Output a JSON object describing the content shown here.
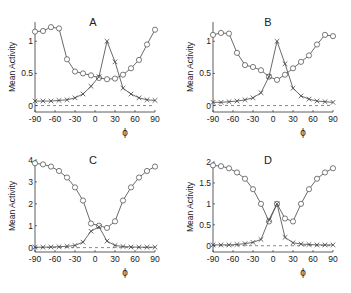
{
  "chart_data": [
    {
      "type": "line",
      "title": "A",
      "xlabel": "ϕ",
      "ylabel": "Mean Activity",
      "xlim": [
        -90,
        90
      ],
      "ylim": [
        -0.1,
        1.3
      ],
      "xticks": [
        -90,
        -60,
        -30,
        0,
        30,
        60,
        90
      ],
      "yticks": [
        0,
        0.5,
        1
      ],
      "ytick_labels": [
        "0",
        "0.5",
        "1"
      ],
      "x": [
        -90,
        -78,
        -66,
        -54,
        -42,
        -30,
        -18,
        -6,
        6,
        18,
        30,
        42,
        54,
        66,
        78,
        90
      ],
      "series": [
        {
          "name": "circles",
          "marker": "o",
          "values": [
            1.15,
            1.16,
            1.22,
            1.2,
            0.72,
            0.53,
            0.5,
            0.47,
            0.43,
            0.41,
            0.42,
            0.48,
            0.58,
            0.71,
            0.95,
            1.18
          ]
        },
        {
          "name": "crosses",
          "marker": "x",
          "values": [
            0.07,
            0.07,
            0.07,
            0.08,
            0.09,
            0.12,
            0.18,
            0.3,
            0.45,
            1.0,
            0.68,
            0.27,
            0.18,
            0.12,
            0.09,
            0.08
          ]
        }
      ],
      "baseline": 0
    },
    {
      "type": "line",
      "title": "B",
      "xlabel": "ϕ",
      "ylabel": "Mean Activity",
      "xlim": [
        -90,
        90
      ],
      "ylim": [
        -0.1,
        1.3
      ],
      "xticks": [
        -90,
        -60,
        -30,
        0,
        30,
        60,
        90
      ],
      "yticks": [
        0,
        0.5,
        1
      ],
      "ytick_labels": [
        "0",
        "0.5",
        "1"
      ],
      "x": [
        -90,
        -78,
        -66,
        -54,
        -42,
        -30,
        -18,
        -6,
        6,
        18,
        30,
        42,
        54,
        66,
        78,
        90
      ],
      "series": [
        {
          "name": "circles",
          "marker": "o",
          "values": [
            1.1,
            1.13,
            1.12,
            0.82,
            0.63,
            0.6,
            0.55,
            0.45,
            0.4,
            0.48,
            0.58,
            0.68,
            0.78,
            0.95,
            1.1,
            1.08
          ]
        },
        {
          "name": "crosses",
          "marker": "x",
          "values": [
            0.05,
            0.05,
            0.06,
            0.07,
            0.09,
            0.12,
            0.2,
            0.45,
            1.0,
            0.65,
            0.27,
            0.15,
            0.1,
            0.07,
            0.06,
            0.05
          ]
        }
      ],
      "baseline": 0
    },
    {
      "type": "line",
      "title": "C",
      "xlabel": "ϕ",
      "ylabel": "Mean Activity",
      "xlim": [
        -90,
        90
      ],
      "ylim": [
        -0.2,
        4.0
      ],
      "xticks": [
        -90,
        -60,
        -30,
        0,
        30,
        60,
        90
      ],
      "yticks": [
        0,
        1,
        2,
        3,
        4
      ],
      "ytick_labels": [
        "0",
        "1",
        "2",
        "3",
        "4"
      ],
      "x": [
        -90,
        -78,
        -66,
        -54,
        -42,
        -30,
        -18,
        -6,
        6,
        18,
        30,
        42,
        54,
        66,
        78,
        90
      ],
      "series": [
        {
          "name": "circles",
          "marker": "o",
          "values": [
            3.85,
            3.8,
            3.7,
            3.5,
            3.2,
            2.75,
            2.15,
            1.1,
            1.0,
            0.9,
            1.2,
            2.15,
            2.75,
            3.2,
            3.5,
            3.7
          ]
        },
        {
          "name": "crosses",
          "marker": "x",
          "values": [
            0.02,
            0.02,
            0.03,
            0.04,
            0.06,
            0.1,
            0.25,
            0.75,
            0.95,
            0.3,
            0.1,
            0.05,
            0.03,
            0.02,
            0.02,
            0.02
          ]
        }
      ],
      "baseline": 0
    },
    {
      "type": "line",
      "title": "D",
      "xlabel": "ϕ",
      "ylabel": "Mean Activity",
      "xlim": [
        -90,
        90
      ],
      "ylim": [
        -0.15,
        2.0
      ],
      "xticks": [
        -90,
        -60,
        -30,
        0,
        30,
        60,
        90
      ],
      "yticks": [
        0,
        0.5,
        1,
        1.5,
        2
      ],
      "ytick_labels": [
        "0",
        "0.5",
        "1",
        "1.5",
        "2"
      ],
      "x": [
        -90,
        -78,
        -66,
        -54,
        -42,
        -30,
        -18,
        -6,
        6,
        18,
        30,
        42,
        54,
        66,
        78,
        90
      ],
      "series": [
        {
          "name": "circles",
          "marker": "o",
          "values": [
            1.92,
            1.9,
            1.85,
            1.75,
            1.6,
            1.35,
            1.0,
            0.58,
            1.0,
            0.65,
            0.58,
            1.0,
            1.35,
            1.6,
            1.75,
            1.85
          ]
        },
        {
          "name": "crosses",
          "marker": "x",
          "values": [
            0.02,
            0.02,
            0.02,
            0.03,
            0.05,
            0.08,
            0.15,
            0.62,
            1.0,
            0.2,
            0.07,
            0.04,
            0.03,
            0.02,
            0.02,
            0.02
          ]
        }
      ],
      "baseline": 0
    }
  ]
}
